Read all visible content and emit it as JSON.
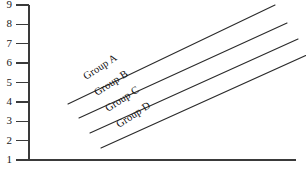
{
  "chart_data": {
    "type": "line",
    "title": "",
    "subtitle": "",
    "xlabel": "",
    "ylabel": "",
    "ylim": [
      1,
      9
    ],
    "xlim": [
      0,
      10
    ],
    "grid": false,
    "legend_position": "inline-on-line",
    "y_ticks": [
      "9",
      "8",
      "7",
      "6",
      "5",
      "4",
      "3",
      "2",
      "1"
    ],
    "y_tick_values": [
      9,
      8,
      7,
      6,
      5,
      4,
      3,
      2,
      1
    ],
    "x_ticks": [],
    "series": [
      {
        "name": "Group A",
        "label": "Group A",
        "x": [
          1.75,
          9.1
        ],
        "values": [
          4.05,
          8.95
        ],
        "start_point": [
          1.75,
          4.05
        ],
        "end_point": [
          9.1,
          8.95
        ]
      },
      {
        "name": "Group B",
        "label": "Group B",
        "x": [
          2.15,
          9.55
        ],
        "values": [
          3.3,
          8.2
        ],
        "start_point": [
          2.15,
          3.3
        ],
        "end_point": [
          9.55,
          8.2
        ]
      },
      {
        "name": "Group C",
        "label": "Group C",
        "x": [
          2.55,
          9.95
        ],
        "values": [
          2.55,
          7.4
        ],
        "start_point": [
          2.55,
          2.55
        ],
        "end_point": [
          9.95,
          7.4
        ]
      },
      {
        "name": "Group D",
        "label": "Group D",
        "x": [
          2.95,
          10.35
        ],
        "values": [
          1.75,
          6.6
        ],
        "start_point": [
          2.95,
          1.75
        ],
        "end_point": [
          10.35,
          6.6
        ]
      }
    ],
    "colors": {
      "line": "#2b2b2b",
      "axis": "#3a3a3a",
      "text": "#101010",
      "background": "#ffffff"
    }
  },
  "geometry": {
    "axis_x": 29,
    "axis_top_y": 5,
    "axis_bottom_y": 160,
    "tick_left_x": 16,
    "x_axis_right_x": 296,
    "label_rotation_deg": -33,
    "lines": [
      {
        "x1": 68,
        "y1": 104,
        "x2": 275,
        "y2": 5,
        "label_x": 86,
        "label_y": 80
      },
      {
        "x1": 79,
        "y1": 118,
        "x2": 287,
        "y2": 23,
        "label_x": 97,
        "label_y": 96
      },
      {
        "x1": 90,
        "y1": 133,
        "x2": 298,
        "y2": 39,
        "label_x": 108,
        "label_y": 112
      },
      {
        "x1": 101,
        "y1": 148,
        "x2": 309,
        "y2": 54,
        "label_x": 119,
        "label_y": 128
      }
    ]
  }
}
